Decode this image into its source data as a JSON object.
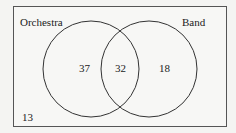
{
  "diagram": {
    "type": "venn",
    "sets": [
      {
        "name": "Orchestra",
        "only": 37
      },
      {
        "name": "Band",
        "only": 18
      }
    ],
    "intersection": 32,
    "outside": 13,
    "labels": {
      "orchestra": "Orchestra",
      "band": "Band",
      "orchestra_only": "37",
      "both": "32",
      "band_only": "18",
      "neither": "13"
    }
  }
}
